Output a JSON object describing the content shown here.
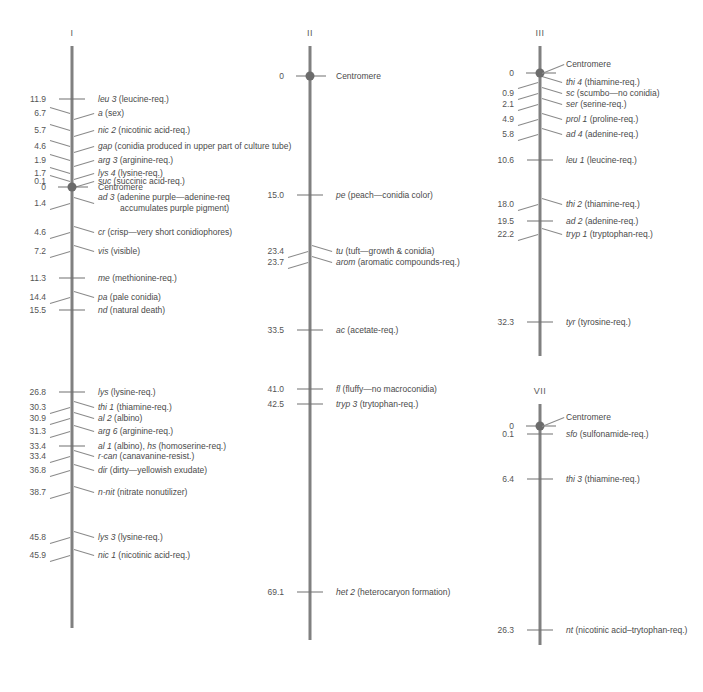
{
  "figure": {
    "background": "#ffffff",
    "line_color": "#808080",
    "text_color": "#4a4a4a",
    "centromere_color": "#6b6b6b"
  },
  "chart_data": {
    "type": "diagram",
    "units": "map units (recombination %)",
    "chromosomes": [
      {
        "name": "I",
        "axis_x": 72,
        "axis_top": 46,
        "axis_bottom": 628,
        "centromere": {
          "position": "0",
          "label": "Centromere",
          "y": 187
        },
        "loci": [
          {
            "position": "11.9",
            "gene": "leu 3",
            "desc": "(leucine-req.)",
            "y": 99,
            "style": "tick"
          },
          {
            "position": "6.7",
            "gene": "a",
            "desc": "(sex)",
            "y": 113,
            "style": "leader"
          },
          {
            "position": "5.7",
            "gene": "nic 2",
            "desc": "(nicotinic acid-req.)",
            "y": 130,
            "style": "leader"
          },
          {
            "position": "4.6",
            "gene": "gap",
            "desc": "(conidia produced in upper part of culture tube)",
            "y": 146,
            "style": "leader"
          },
          {
            "position": "1.9",
            "gene": "arg 3",
            "desc": "(arginine-req.)",
            "y": 160,
            "style": "leader"
          },
          {
            "position": "1.7",
            "gene": "lys 4",
            "desc": "(lysine-req.)",
            "y": 173,
            "style": "leader"
          },
          {
            "position": "0.1",
            "gene": "suc",
            "desc": "(succinic acid-req.)",
            "y": 181,
            "style": "leader"
          },
          {
            "position": "1.4",
            "gene": "ad 3",
            "desc": "(adenine purple—adenine-req",
            "desc2": "accumulates purple pigment)",
            "y": 203,
            "style": "leader"
          },
          {
            "position": "4.6",
            "gene": "cr",
            "desc": "(crisp—very short conidiophores)",
            "y": 232,
            "style": "leader"
          },
          {
            "position": "7.2",
            "gene": "vis",
            "desc": "(visible)",
            "y": 251,
            "style": "leader"
          },
          {
            "position": "11.3",
            "gene": "me",
            "desc": "(methionine-req.)",
            "y": 278,
            "style": "tick"
          },
          {
            "position": "14.4",
            "gene": "pa",
            "desc": "(pale conidia)",
            "y": 297,
            "style": "leader"
          },
          {
            "position": "15.5",
            "gene": "nd",
            "desc": "(natural death)",
            "y": 310,
            "style": "tick"
          },
          {
            "position": "26.8",
            "gene": "lys",
            "desc": "(lysine-req.)",
            "y": 392,
            "style": "tick"
          },
          {
            "position": "30.3",
            "gene": "thi 1",
            "desc": "(thiamine-req.)",
            "y": 407,
            "style": "leader"
          },
          {
            "position": "30.9",
            "gene": "al 2",
            "desc": "(albino)",
            "y": 418,
            "style": "leader"
          },
          {
            "position": "31.3",
            "gene": "arg 6",
            "desc": "(arginine-req.)",
            "y": 431,
            "style": "leader"
          },
          {
            "position": "33.4",
            "gene": "al 1",
            "desc": "(albino), ",
            "gene2": "hs",
            "desc2_inline": "(homoserine-req.)",
            "y": 446,
            "style": "tick"
          },
          {
            "position": "33.4",
            "gene": "r-can",
            "desc": "(canavanine-resist.)",
            "y": 456,
            "style": "leader"
          },
          {
            "position": "36.8",
            "gene": "dir",
            "desc": "(dirty—yellowish exudate)",
            "y": 470,
            "style": "leader"
          },
          {
            "position": "38.7",
            "gene": "n-nit",
            "desc": "(nitrate nonutilizer)",
            "y": 492,
            "style": "leader"
          },
          {
            "position": "45.8",
            "gene": "lys 3",
            "desc": "(lysine-req.)",
            "y": 537,
            "style": "leader"
          },
          {
            "position": "45.9",
            "gene": "nic 1",
            "desc": "(nicotinic acid-req.)",
            "y": 555,
            "style": "leader"
          }
        ]
      },
      {
        "name": "II",
        "axis_x": 310,
        "axis_top": 46,
        "axis_bottom": 640,
        "centromere": {
          "position": "0",
          "label": "Centromere",
          "y": 76
        },
        "loci": [
          {
            "position": "15.0",
            "gene": "pe",
            "desc": "(peach—conidia color)",
            "y": 195,
            "style": "tick"
          },
          {
            "position": "23.4",
            "gene": "tu",
            "desc": "(tuft—growth & conidia)",
            "y": 251,
            "style": "leader"
          },
          {
            "position": "23.7",
            "gene": "arom",
            "desc": "(aromatic compounds-req.)",
            "y": 262,
            "style": "leader"
          },
          {
            "position": "33.5",
            "gene": "ac",
            "desc": "(acetate-req.)",
            "y": 330,
            "style": "tick"
          },
          {
            "position": "41.0",
            "gene": "fl",
            "desc": "(fluffy—no macroconidia)",
            "y": 389,
            "style": "tick"
          },
          {
            "position": "42.5",
            "gene": "tryp 3",
            "desc": "(trytophan-req.)",
            "y": 404,
            "style": "tick"
          },
          {
            "position": "69.1",
            "gene": "het 2",
            "desc": "(heterocaryon formation)",
            "y": 592,
            "style": "tick"
          }
        ]
      },
      {
        "name": "III",
        "axis_x": 540,
        "axis_top": 46,
        "axis_bottom": 356,
        "centromere": {
          "position": "0",
          "label": "Centromere",
          "y": 73
        },
        "loci": [
          {
            "position": "",
            "gene": "thi 4",
            "desc": "(thiamine-req.)",
            "y": 82,
            "style": "leader"
          },
          {
            "position": "0.9",
            "gene": "sc",
            "desc": "(scumbo—no conidia)",
            "y": 93,
            "style": "leader"
          },
          {
            "position": "2.1",
            "gene": "ser",
            "desc": "(serine-req.)",
            "y": 104,
            "style": "leader"
          },
          {
            "position": "4.9",
            "gene": "prol 1",
            "desc": "(proline-req.)",
            "y": 119,
            "style": "leader"
          },
          {
            "position": "5.8",
            "gene": "ad 4",
            "desc": "(adenine-req.)",
            "y": 134,
            "style": "leader"
          },
          {
            "position": "10.6",
            "gene": "leu 1",
            "desc": "(leucine-req.)",
            "y": 160,
            "style": "tick"
          },
          {
            "position": "18.0",
            "gene": "thi 2",
            "desc": "(thiamine-req.)",
            "y": 204,
            "style": "leader"
          },
          {
            "position": "19.5",
            "gene": "ad 2",
            "desc": "(adenine-req.)",
            "y": 221,
            "style": "tick"
          },
          {
            "position": "22.2",
            "gene": "tryp 1",
            "desc": "(tryptophan-req.)",
            "y": 234,
            "style": "leader"
          },
          {
            "position": "32.3",
            "gene": "tyr",
            "desc": "(tyrosine-req.)",
            "y": 322,
            "style": "tick"
          }
        ]
      },
      {
        "name": "VII",
        "axis_x": 540,
        "axis_top": 404,
        "axis_bottom": 645,
        "centromere": {
          "position": "0",
          "label": "Centromere",
          "y": 426
        },
        "loci": [
          {
            "position": "0.1",
            "gene": "sfo",
            "desc": "(sulfonamide-req.)",
            "y": 434,
            "style": "tick"
          },
          {
            "position": "6.4",
            "gene": "thi 3",
            "desc": "(thiamine-req.)",
            "y": 479,
            "style": "tick"
          },
          {
            "position": "26.3",
            "gene": "nt",
            "desc": "(nicotinic acid–trytophan-req.)",
            "y": 630,
            "style": "tick"
          }
        ]
      }
    ]
  }
}
